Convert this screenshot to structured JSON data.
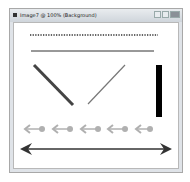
{
  "window": {
    "title": "Image7 @ 100% (Background)",
    "controls": [
      {
        "name": "minimize",
        "icon": "minimize-icon"
      },
      {
        "name": "maximize",
        "icon": "maximize-icon"
      },
      {
        "name": "close",
        "icon": "close-icon"
      }
    ]
  },
  "canvas": {
    "shapes": [
      {
        "type": "dotted-line",
        "color": "#333333"
      },
      {
        "type": "solid-line",
        "color": "#333333"
      },
      {
        "type": "diagonal-line-thick",
        "color": "#444444"
      },
      {
        "type": "diagonal-line-thin",
        "color": "#777777"
      },
      {
        "type": "vertical-bar",
        "color": "#000000"
      },
      {
        "type": "arrow-row",
        "count": 5,
        "color": "#b0b0b0"
      },
      {
        "type": "double-arrow",
        "color": "#333333"
      }
    ]
  }
}
